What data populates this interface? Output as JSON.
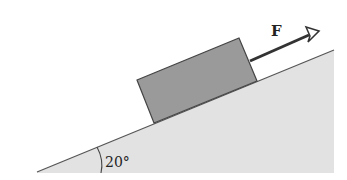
{
  "diagram": {
    "type": "physics-free-body",
    "incline": {
      "angle_label": "20°",
      "fill_color": "#e2e2e2",
      "edge_color": "#555555"
    },
    "block": {
      "fill_color": "#9a9a9a",
      "edge_color": "#444444"
    },
    "force": {
      "label": "F",
      "color": "#333333"
    }
  }
}
